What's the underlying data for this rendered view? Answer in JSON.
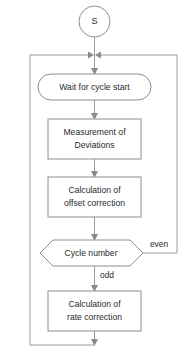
{
  "diagram": {
    "canvas": {
      "width": 189,
      "height": 362,
      "background": "#ffffff"
    },
    "colors": {
      "shape_stroke": "#8e8e8e",
      "connector_stroke": "#9a9a9a",
      "arrowhead": "#8a8a8a",
      "text": "#2b2b2b",
      "shape_fill": "#ffffff"
    },
    "nodes": {
      "start": {
        "label": "S",
        "shape": "circle"
      },
      "wait": {
        "label": "Wait for cycle start",
        "shape": "stadium"
      },
      "measure": {
        "line1": "Measurement of",
        "line2": "Deviations",
        "shape": "rectangle"
      },
      "offset": {
        "line1": "Calculation of",
        "line2": "offset correction",
        "shape": "rectangle"
      },
      "decision": {
        "label": "Cycle number",
        "shape": "hexagon"
      },
      "rate": {
        "line1": "Calculation of",
        "line2": "rate correction",
        "shape": "rectangle"
      }
    },
    "edge_labels": {
      "even": "even",
      "odd": "odd"
    }
  }
}
